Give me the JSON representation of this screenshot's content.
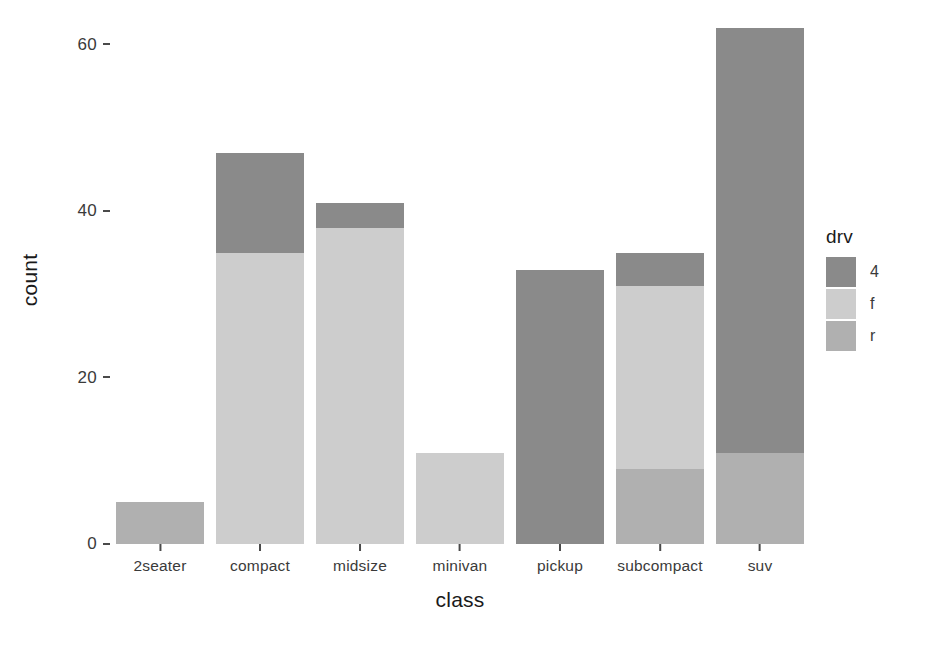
{
  "chart_data": {
    "type": "bar",
    "stacked": true,
    "title": "",
    "xlabel": "class",
    "ylabel": "count",
    "categories": [
      "2seater",
      "compact",
      "midsize",
      "minivan",
      "pickup",
      "subcompact",
      "suv"
    ],
    "series": [
      {
        "name": "4",
        "color": "#8a8a8a",
        "values": [
          0,
          12,
          3,
          0,
          33,
          4,
          51
        ]
      },
      {
        "name": "f",
        "color": "#cdcdcd",
        "values": [
          0,
          35,
          38,
          11,
          0,
          22,
          0
        ]
      },
      {
        "name": "r",
        "color": "#b0b0b0",
        "values": [
          5,
          0,
          0,
          0,
          0,
          9,
          11
        ]
      }
    ],
    "stack_order_bottom_to_top": [
      "r",
      "f",
      "4"
    ],
    "totals": [
      5,
      47,
      41,
      11,
      33,
      35,
      62
    ],
    "ylim": [
      0,
      63
    ],
    "yticks": [
      0,
      20,
      40,
      60
    ],
    "ytick_labels": [
      "0",
      "20",
      "40",
      "60"
    ],
    "grid": false,
    "legend": {
      "title": "drv",
      "position": "right",
      "entries": [
        {
          "label": "4",
          "color": "#8a8a8a"
        },
        {
          "label": "f",
          "color": "#cdcdcd"
        },
        {
          "label": "r",
          "color": "#b0b0b0"
        }
      ]
    }
  }
}
